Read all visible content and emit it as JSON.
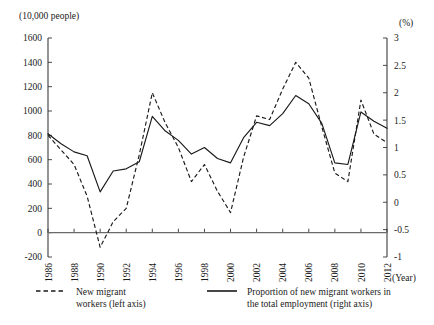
{
  "chart_data": {
    "type": "line",
    "title": "",
    "xlabel": "(Year)",
    "ylabel_left": "(10,000 people)",
    "ylabel_right": "(%)",
    "grid": false,
    "legend_position": "bottom",
    "x": [
      1986,
      1987,
      1988,
      1989,
      1990,
      1991,
      1992,
      1993,
      1994,
      1995,
      1996,
      1997,
      1998,
      1999,
      2000,
      2001,
      2002,
      2003,
      2004,
      2005,
      2006,
      2007,
      2008,
      2009,
      2010,
      2011,
      2012
    ],
    "xtick_labels": [
      "1986",
      "1988",
      "1990",
      "1992",
      "1994",
      "1996",
      "1998",
      "2000",
      "2002",
      "2004",
      "2006",
      "2008",
      "2010",
      "2012"
    ],
    "xticks": [
      1986,
      1988,
      1990,
      1992,
      1994,
      1996,
      1998,
      2000,
      2002,
      2004,
      2006,
      2008,
      2010,
      2012
    ],
    "ylim_left": [
      -200,
      1600
    ],
    "yticks_left": [
      -200,
      0,
      200,
      400,
      600,
      800,
      1000,
      1200,
      1400,
      1600
    ],
    "ytick_labels_left": [
      "-200",
      "0",
      "200",
      "400",
      "600",
      "800",
      "1000",
      "1200",
      "1400",
      "1600"
    ],
    "ylim_right": [
      -1,
      3
    ],
    "yticks_right": [
      -1,
      -0.5,
      0,
      0.5,
      1,
      1.5,
      2,
      2.5,
      3
    ],
    "ytick_labels_right": [
      "-1",
      "-0.5",
      "0",
      "0.5",
      "1",
      "1.5",
      "2",
      "2.5",
      "3"
    ],
    "series": [
      {
        "name": "New migrant workers (left axis)",
        "axis": "left",
        "style": "dashed",
        "values": [
          800,
          680,
          560,
          300,
          -120,
          90,
          200,
          640,
          1150,
          900,
          700,
          420,
          560,
          340,
          165,
          620,
          960,
          930,
          1180,
          1400,
          1270,
          870,
          490,
          420,
          1090,
          810,
          740
        ]
      },
      {
        "name": "Proportion of new migrant workers in the total employment (right axis)",
        "axis": "right",
        "style": "solid",
        "values": [
          1.25,
          1.07,
          0.92,
          0.85,
          0.19,
          0.57,
          0.61,
          0.74,
          1.57,
          1.3,
          1.13,
          0.88,
          1.0,
          0.8,
          0.72,
          1.18,
          1.46,
          1.4,
          1.62,
          1.95,
          1.8,
          1.44,
          0.72,
          0.69,
          1.65,
          1.48,
          1.35
        ]
      }
    ],
    "legend": [
      {
        "label_line1": "New migrant",
        "label_line2": "workers (left axis)",
        "style": "dashed",
        "name": "legend-new-migrant-workers"
      },
      {
        "label_line1": "Proportion of new migrant workers in",
        "label_line2": "the total employment (right axis)",
        "style": "solid",
        "name": "legend-proportion"
      }
    ]
  }
}
